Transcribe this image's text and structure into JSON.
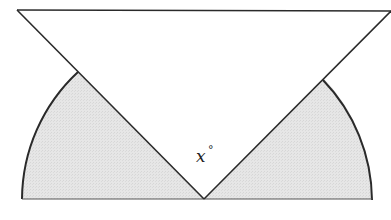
{
  "figure": {
    "angle_label": {
      "variable": "x",
      "unit_symbol": "°"
    },
    "colors": {
      "stroke": "#2a2a2a",
      "shaded_fill": "#e4e4e4",
      "triangle_fill": "#ffffff"
    }
  }
}
